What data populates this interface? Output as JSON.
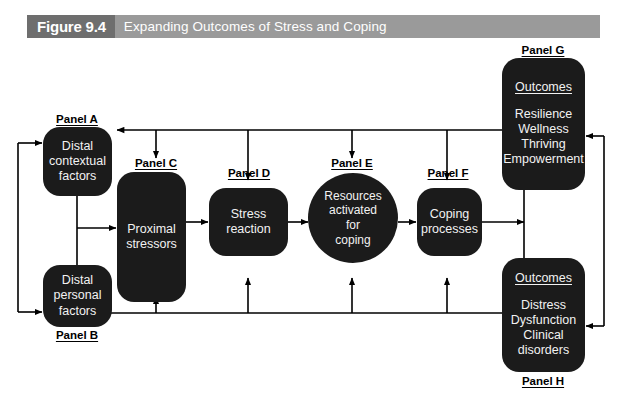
{
  "figure": {
    "number_label": "Figure 9.4",
    "title": "Expanding Outcomes of Stress and Coping",
    "banner_dark_color": "#6e6e6e",
    "banner_light_color": "#9a9a9a",
    "node_color": "#1b1b1b",
    "node_text_color": "#f2f2f2",
    "background_color": "#ffffff",
    "line_color": "#000000"
  },
  "panels": {
    "a": {
      "caption": "Panel A",
      "lines": [
        "Distal",
        "contextual",
        "factors"
      ]
    },
    "b": {
      "caption": "Panel B",
      "lines": [
        "Distal",
        "personal",
        "factors"
      ]
    },
    "c": {
      "caption": "Panel C",
      "lines": [
        "Proximal",
        "stressors"
      ]
    },
    "d": {
      "caption": "Panel D",
      "lines": [
        "Stress",
        "reaction"
      ]
    },
    "e": {
      "caption": "Panel E",
      "lines": [
        "Resources",
        "activated",
        "for",
        "coping"
      ]
    },
    "f": {
      "caption": "Panel F",
      "lines": [
        "Coping",
        "processes"
      ]
    },
    "g": {
      "caption": "Panel G",
      "heading": "Outcomes",
      "lines": [
        "Resilience",
        "Wellness",
        "Thriving",
        "Empowerment"
      ]
    },
    "h": {
      "caption": "Panel H",
      "heading": "Outcomes",
      "lines": [
        "Distress",
        "Dysfunction",
        "Clinical",
        "disorders"
      ]
    }
  }
}
